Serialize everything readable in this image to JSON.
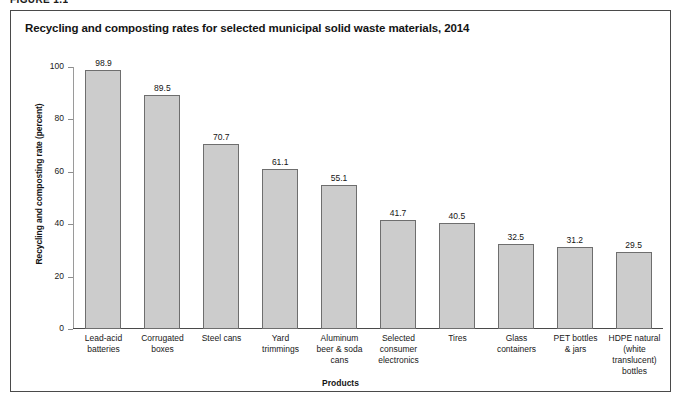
{
  "figure": {
    "label": "FIGURE 1.1"
  },
  "chart_data": {
    "type": "bar",
    "title": "Recycling and composting rates for selected municipal solid waste materials, 2014",
    "xlabel": "Products",
    "ylabel": "Recycling and composting rate (percent)",
    "ylim": [
      0,
      100
    ],
    "yticks": [
      0,
      20,
      40,
      60,
      80,
      100
    ],
    "ytick_labels": [
      "0",
      "20",
      "40",
      "60",
      "80",
      "100"
    ],
    "grid": false,
    "legend": null,
    "bar_color": "#cccccc",
    "bar_border_color": "#6e6e6e",
    "categories": [
      "Lead-acid batteries",
      "Corrugated boxes",
      "Steel cans",
      "Yard trimmings",
      "Aluminum beer & soda cans",
      "Selected consumer electronics",
      "Tires",
      "Glass containers",
      "PET bottles & jars",
      "HDPE natural (white translucent) bottles"
    ],
    "category_lines": [
      [
        "Lead-acid",
        "batteries"
      ],
      [
        "Corrugated",
        "boxes"
      ],
      [
        "Steel cans"
      ],
      [
        "Yard",
        "trimmings"
      ],
      [
        "Aluminum",
        "beer & soda",
        "cans"
      ],
      [
        "Selected",
        "consumer",
        "electronics"
      ],
      [
        "Tires"
      ],
      [
        "Glass",
        "containers"
      ],
      [
        "PET bottles",
        "& jars"
      ],
      [
        "HDPE natural",
        "(white translucent)",
        "bottles"
      ]
    ],
    "values": [
      98.9,
      89.5,
      70.7,
      61.1,
      55.1,
      41.7,
      40.5,
      32.5,
      31.2,
      29.5
    ],
    "value_labels": [
      "98.9",
      "89.5",
      "70.7",
      "61.1",
      "55.1",
      "41.7",
      "40.5",
      "32.5",
      "31.2",
      "29.5"
    ]
  }
}
